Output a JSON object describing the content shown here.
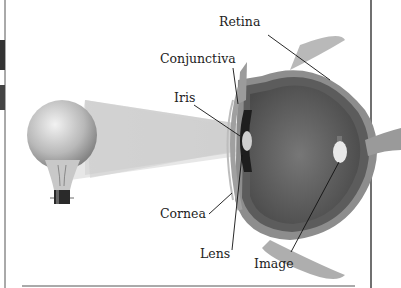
{
  "diagram": {
    "title": "",
    "labels": {
      "retina": "Retina",
      "conjunctiva": "Conjunctiva",
      "iris": "Iris",
      "cornea": "Cornea",
      "lens": "Lens",
      "image": "Image"
    },
    "objects": {
      "light_source": "light-bulb",
      "eye": "eye-cross-section"
    },
    "colors": {
      "background": "#ffffff",
      "text": "#222222",
      "eye_outer": "#8a8a8a",
      "eye_inner": "#5a5a5a",
      "light_beam": "#cfcfcf",
      "leader_line": "#111111"
    }
  }
}
